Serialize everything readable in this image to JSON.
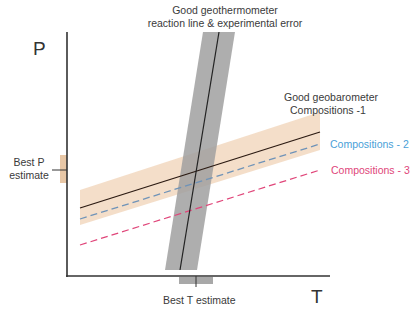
{
  "title": {
    "line1": "Good geothermometer",
    "line2": "reaction line & experimental error"
  },
  "axes": {
    "y_label": "P",
    "x_label": "T"
  },
  "labels": {
    "geobarometer_line1": "Good geobarometer",
    "geobarometer_line2": "Compositions -1",
    "composition2": "Compositions - 2",
    "composition3": "Compositions - 3",
    "best_p_line1": "Best P",
    "best_p_line2": "estimate",
    "best_t": "Best T estimate"
  },
  "colors": {
    "axis": "#333333",
    "geothermometer_band": "#a8a8a8",
    "geobarometer_band": "#f3dcc6",
    "composition1_line": "#2b1a12",
    "composition2_line": "#6f93b8",
    "composition3_line": "#e0467a",
    "composition2_text": "#4a9fd8",
    "composition3_text": "#e0467a",
    "best_p_marker": "#e8c7a6",
    "best_t_marker": "#a8a8a8"
  }
}
